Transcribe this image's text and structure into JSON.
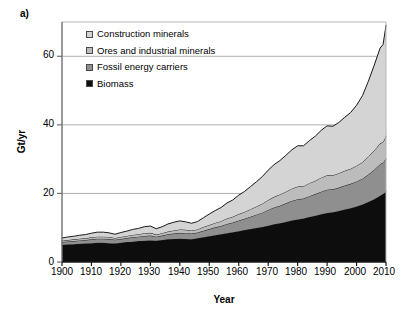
{
  "figure": {
    "panel_label": "a)",
    "xlabel": "Year",
    "ylabel": "Gt/yr"
  },
  "legend": {
    "items": [
      {
        "label": "Construction minerals",
        "color": "#d4d4d4"
      },
      {
        "label": "Ores and industrial minerals",
        "color": "#bcbcbc"
      },
      {
        "label": "Fossil energy carriers",
        "color": "#8f8f8f"
      },
      {
        "label": "Biomass",
        "color": "#0d0d0d"
      }
    ]
  },
  "axes": {
    "y_ticks": [
      "0",
      "20",
      "40",
      "60"
    ],
    "x_ticks": [
      "1900",
      "1910",
      "1920",
      "1930",
      "1940",
      "1950",
      "1960",
      "1970",
      "1980",
      "1990",
      "2000",
      "2010"
    ]
  },
  "chart_data": {
    "type": "area",
    "stacked": true,
    "title": "",
    "xlabel": "Year",
    "ylabel": "Gt/yr",
    "xlim": [
      1900,
      2010
    ],
    "ylim": [
      0,
      70
    ],
    "y_ticks": [
      0,
      20,
      40,
      60
    ],
    "x_ticks": [
      1900,
      1910,
      1920,
      1930,
      1940,
      1950,
      1960,
      1970,
      1980,
      1990,
      2000,
      2010
    ],
    "grid": "horizontal",
    "legend_position": "upper-left-inside",
    "units": "Gt/yr",
    "x": [
      1900,
      1902,
      1904,
      1906,
      1908,
      1910,
      1912,
      1914,
      1916,
      1918,
      1920,
      1922,
      1924,
      1926,
      1928,
      1930,
      1932,
      1934,
      1936,
      1938,
      1940,
      1942,
      1944,
      1946,
      1948,
      1950,
      1952,
      1954,
      1956,
      1958,
      1960,
      1962,
      1964,
      1966,
      1968,
      1970,
      1972,
      1974,
      1976,
      1978,
      1980,
      1982,
      1984,
      1986,
      1988,
      1990,
      1992,
      1994,
      1996,
      1998,
      2000,
      2002,
      2004,
      2006,
      2008,
      2009,
      2010
    ],
    "series": [
      {
        "name": "Biomass",
        "color": "#0d0d0d",
        "values": [
          5.0,
          5.1,
          5.2,
          5.3,
          5.4,
          5.5,
          5.6,
          5.6,
          5.5,
          5.4,
          5.6,
          5.8,
          5.9,
          6.1,
          6.2,
          6.3,
          6.2,
          6.4,
          6.6,
          6.7,
          6.8,
          6.7,
          6.6,
          6.9,
          7.2,
          7.5,
          7.8,
          8.1,
          8.4,
          8.7,
          9.0,
          9.3,
          9.6,
          9.9,
          10.2,
          10.6,
          11.0,
          11.3,
          11.7,
          12.1,
          12.4,
          12.7,
          13.1,
          13.5,
          13.9,
          14.3,
          14.5,
          14.9,
          15.3,
          15.7,
          16.2,
          16.8,
          17.5,
          18.3,
          19.3,
          19.8,
          20.5
        ]
      },
      {
        "name": "Fossil energy carriers",
        "color": "#8f8f8f",
        "values": [
          0.8,
          0.9,
          0.9,
          1.0,
          1.0,
          1.1,
          1.2,
          1.2,
          1.2,
          1.1,
          1.1,
          1.2,
          1.3,
          1.3,
          1.4,
          1.4,
          1.2,
          1.3,
          1.5,
          1.6,
          1.7,
          1.7,
          1.7,
          1.7,
          1.9,
          2.1,
          2.3,
          2.4,
          2.7,
          2.8,
          3.1,
          3.3,
          3.6,
          3.9,
          4.2,
          4.6,
          4.9,
          5.1,
          5.4,
          5.7,
          5.9,
          5.8,
          6.1,
          6.3,
          6.6,
          6.8,
          6.7,
          6.8,
          7.0,
          7.1,
          7.3,
          7.5,
          8.0,
          8.6,
          9.2,
          9.2,
          9.6
        ]
      },
      {
        "name": "Ores and industrial minerals",
        "color": "#bcbcbc",
        "values": [
          0.4,
          0.4,
          0.5,
          0.5,
          0.5,
          0.6,
          0.6,
          0.6,
          0.6,
          0.5,
          0.6,
          0.6,
          0.7,
          0.7,
          0.8,
          0.8,
          0.6,
          0.7,
          0.8,
          0.9,
          1.0,
          1.0,
          0.9,
          0.9,
          1.1,
          1.2,
          1.3,
          1.4,
          1.6,
          1.7,
          1.9,
          2.0,
          2.2,
          2.4,
          2.6,
          2.9,
          3.1,
          3.3,
          3.4,
          3.6,
          3.7,
          3.6,
          3.8,
          3.9,
          4.1,
          4.2,
          4.1,
          4.2,
          4.3,
          4.4,
          4.6,
          4.8,
          5.2,
          5.6,
          6.1,
          6.0,
          6.6
        ]
      },
      {
        "name": "Construction minerals",
        "color": "#d4d4d4",
        "values": [
          0.8,
          0.9,
          0.9,
          1.0,
          1.1,
          1.2,
          1.3,
          1.3,
          1.2,
          1.1,
          1.3,
          1.4,
          1.6,
          1.7,
          1.9,
          2.0,
          1.7,
          1.9,
          2.2,
          2.4,
          2.5,
          2.3,
          2.1,
          2.3,
          2.7,
          3.2,
          3.6,
          4.0,
          4.5,
          4.9,
          5.5,
          6.0,
          6.6,
          7.2,
          7.9,
          8.7,
          9.4,
          9.9,
          10.6,
          11.3,
          11.9,
          11.8,
          12.4,
          13.0,
          13.8,
          14.4,
          14.3,
          14.8,
          15.6,
          16.4,
          17.6,
          19.4,
          22.0,
          24.9,
          27.8,
          28.4,
          32.3
        ]
      }
    ],
    "totals_note": "Total global material extraction rises from about 7 Gt/yr in 1900 to about 69 Gt/yr in 2010"
  }
}
